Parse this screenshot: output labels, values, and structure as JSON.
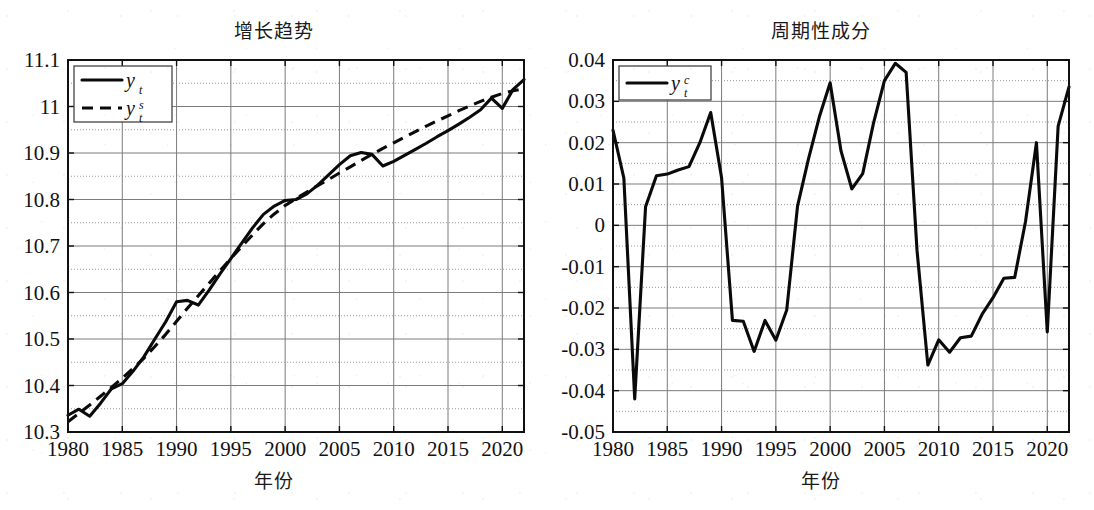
{
  "figure": {
    "background": "#ffffff",
    "ink": "#0a0a0a"
  },
  "panels": [
    {
      "id": "growth-trend",
      "title": "增长趋势",
      "xlabel": "年份",
      "legend": [
        {
          "base": "y",
          "sub": "t",
          "sup": "",
          "style": "solid"
        },
        {
          "base": "y",
          "sub": "t",
          "sup": "s",
          "style": "dashed"
        }
      ]
    },
    {
      "id": "cyclical-component",
      "title": "周期性成分",
      "xlabel": "年份",
      "legend": [
        {
          "base": "y",
          "sub": "t",
          "sup": "c",
          "style": "solid"
        }
      ]
    }
  ],
  "chart_data": [
    {
      "type": "line",
      "title": "增长趋势",
      "xlabel": "年份",
      "ylabel": "",
      "xlim": [
        1980,
        2022
      ],
      "ylim": [
        10.3,
        11.1
      ],
      "yticks": [
        "10.3",
        "10.4",
        "10.5",
        "10.6",
        "10.7",
        "10.8",
        "10.9",
        "11",
        "11.1"
      ],
      "ytick_values": [
        10.3,
        10.4,
        10.5,
        10.6,
        10.7,
        10.8,
        10.9,
        11.0,
        11.1
      ],
      "xticks": [
        "1980",
        "1985",
        "1990",
        "1995",
        "2000",
        "2005",
        "2010",
        "2015",
        "2020"
      ],
      "xtick_values": [
        1980,
        1985,
        1990,
        1995,
        2000,
        2005,
        2010,
        2015,
        2020
      ],
      "grid": true,
      "legend_position": "upper left",
      "x": [
        1980,
        1981,
        1982,
        1983,
        1984,
        1985,
        1986,
        1987,
        1988,
        1989,
        1990,
        1991,
        1992,
        1993,
        1994,
        1995,
        1996,
        1997,
        1998,
        1999,
        2000,
        2001,
        2002,
        2003,
        2004,
        2005,
        2006,
        2007,
        2008,
        2009,
        2010,
        2011,
        2012,
        2013,
        2014,
        2015,
        2016,
        2017,
        2018,
        2019,
        2020,
        2021,
        2022
      ],
      "series": [
        {
          "name": "y_t",
          "style": "solid",
          "values": [
            10.336,
            10.349,
            10.334,
            10.362,
            10.393,
            10.404,
            10.431,
            10.462,
            10.5,
            10.537,
            10.58,
            10.583,
            10.573,
            10.605,
            10.64,
            10.673,
            10.706,
            10.739,
            10.768,
            10.786,
            10.798,
            10.8,
            10.812,
            10.831,
            10.853,
            10.875,
            10.894,
            10.901,
            10.897,
            10.872,
            10.882,
            10.895,
            10.908,
            10.921,
            10.935,
            10.948,
            10.962,
            10.977,
            10.993,
            11.018,
            10.996,
            11.037,
            11.058
          ]
        },
        {
          "name": "y_t^s",
          "style": "dashed",
          "values": [
            10.322,
            10.34,
            10.358,
            10.377,
            10.396,
            10.416,
            10.437,
            10.459,
            10.484,
            10.51,
            10.538,
            10.566,
            10.593,
            10.62,
            10.647,
            10.673,
            10.699,
            10.724,
            10.748,
            10.769,
            10.787,
            10.802,
            10.816,
            10.83,
            10.843,
            10.857,
            10.87,
            10.884,
            10.897,
            10.91,
            10.922,
            10.934,
            10.946,
            10.958,
            10.969,
            10.98,
            10.991,
            11.001,
            11.011,
            11.02,
            11.028,
            11.034,
            11.038
          ]
        }
      ]
    },
    {
      "type": "line",
      "title": "周期性成分",
      "xlabel": "年份",
      "ylabel": "",
      "xlim": [
        1980,
        2022
      ],
      "ylim": [
        -0.05,
        0.04
      ],
      "yticks": [
        "-0.05",
        "-0.04",
        "-0.03",
        "-0.02",
        "-0.01",
        "0",
        "0.01",
        "0.02",
        "0.03",
        "0.04"
      ],
      "ytick_values": [
        -0.05,
        -0.04,
        -0.03,
        -0.02,
        -0.01,
        0,
        0.01,
        0.02,
        0.03,
        0.04
      ],
      "xticks": [
        "1980",
        "1985",
        "1990",
        "1995",
        "2000",
        "2005",
        "2010",
        "2015",
        "2020"
      ],
      "xtick_values": [
        1980,
        1985,
        1990,
        1995,
        2000,
        2005,
        2010,
        2015,
        2020
      ],
      "grid": true,
      "legend_position": "upper left",
      "x": [
        1980,
        1981,
        1982,
        1983,
        1984,
        1985,
        1986,
        1987,
        1988,
        1989,
        1990,
        1991,
        1992,
        1993,
        1994,
        1995,
        1996,
        1997,
        1998,
        1999,
        2000,
        2001,
        2002,
        2003,
        2004,
        2005,
        2006,
        2007,
        2008,
        2009,
        2010,
        2011,
        2012,
        2013,
        2014,
        2015,
        2016,
        2017,
        2018,
        2019,
        2020,
        2021,
        2022
      ],
      "series": [
        {
          "name": "y_t^c",
          "style": "solid",
          "values": [
            0.023,
            0.0114,
            -0.042,
            0.0045,
            0.012,
            0.0124,
            0.0134,
            0.0142,
            0.02,
            0.0273,
            0.0115,
            -0.023,
            -0.0232,
            -0.0305,
            -0.023,
            -0.0278,
            -0.0205,
            0.0047,
            0.016,
            0.0262,
            0.0345,
            0.018,
            0.0088,
            0.0125,
            0.0248,
            0.035,
            0.0392,
            0.037,
            -0.006,
            -0.0338,
            -0.0277,
            -0.0307,
            -0.0272,
            -0.0268,
            -0.0215,
            -0.0175,
            -0.0128,
            -0.0126,
            0.001,
            0.02,
            -0.0258,
            0.024,
            0.0335
          ]
        }
      ]
    }
  ]
}
